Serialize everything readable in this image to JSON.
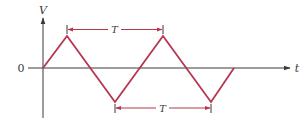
{
  "diagram": {
    "type": "triangle-waveform",
    "axes": {
      "y_label": "V",
      "x_label": "t",
      "origin_label": "0"
    },
    "waveform": {
      "shape": "triangle",
      "points": [
        [
          43,
          68
        ],
        [
          67,
          36
        ],
        [
          115,
          102
        ],
        [
          163,
          36
        ],
        [
          211,
          102
        ],
        [
          234,
          68
        ]
      ]
    },
    "annotations": {
      "top_period_label": "T",
      "bottom_period_label": "T"
    },
    "colors": {
      "waveform": "#b5364f",
      "annotation": "#b5364f",
      "axis": "#3a3a3a",
      "background": "#ffffff"
    }
  }
}
